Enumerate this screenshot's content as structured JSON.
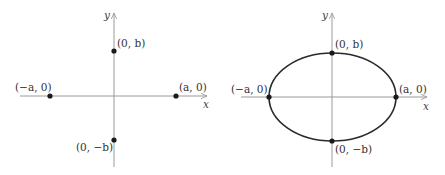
{
  "figures": [
    {
      "id": "left",
      "description": "vertices and co-vertices plotted on axes",
      "axes": {
        "x_label": "x",
        "y_label": "y"
      },
      "points": [
        {
          "label": "(0, b)"
        },
        {
          "label": "(−a, 0)"
        },
        {
          "label": "(a, 0)"
        },
        {
          "label": "(0, −b)"
        }
      ]
    },
    {
      "id": "right",
      "description": "ellipse through the four points",
      "axes": {
        "x_label": "x",
        "y_label": "y"
      },
      "points": [
        {
          "label": "(0, b)"
        },
        {
          "label": "(−a, 0)"
        },
        {
          "label": "(a, 0)"
        },
        {
          "label": "(0, −b)"
        }
      ]
    }
  ],
  "colors": {
    "axis": "#9a9a9a",
    "curve": "#2a2a2a",
    "point": "#1a1a1a"
  }
}
